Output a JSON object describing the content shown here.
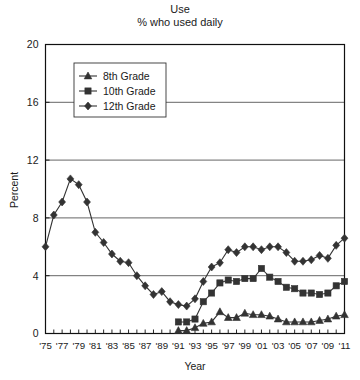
{
  "chart_data": {
    "type": "line",
    "title": "Use",
    "subtitle": "% who used daily",
    "xlabel": "Year",
    "ylabel": "Percent",
    "ylim": [
      0,
      20
    ],
    "yticks": [
      0,
      4,
      8,
      12,
      16,
      20
    ],
    "xlim": [
      1975,
      2011
    ],
    "grid": true,
    "grid_axis": "y",
    "legend_position": "top-left-inside",
    "x": [
      1975,
      1976,
      1977,
      1978,
      1979,
      1980,
      1981,
      1982,
      1983,
      1984,
      1985,
      1986,
      1987,
      1988,
      1989,
      1990,
      1991,
      1992,
      1993,
      1994,
      1995,
      1996,
      1997,
      1998,
      1999,
      2000,
      2001,
      2002,
      2003,
      2004,
      2005,
      2006,
      2007,
      2008,
      2009,
      2010,
      2011
    ],
    "xtick_labels": [
      "'75",
      "'77",
      "'79",
      "'81",
      "'83",
      "'85",
      "'87",
      "'89",
      "'91",
      "'93",
      "'95",
      "'97",
      "'99",
      "'01",
      "'03",
      "'05",
      "'07",
      "'09",
      "'11"
    ],
    "xtick_years": [
      1975,
      1977,
      1979,
      1981,
      1983,
      1985,
      1987,
      1989,
      1991,
      1993,
      1995,
      1997,
      1999,
      2001,
      2003,
      2005,
      2007,
      2009,
      2011
    ],
    "series": [
      {
        "name": "8th Grade",
        "marker": "triangle",
        "color": "#333333",
        "x": [
          1991,
          1992,
          1993,
          1994,
          1995,
          1996,
          1997,
          1998,
          1999,
          2000,
          2001,
          2002,
          2003,
          2004,
          2005,
          2006,
          2007,
          2008,
          2009,
          2010,
          2011
        ],
        "values": [
          0.2,
          0.2,
          0.4,
          0.7,
          0.8,
          1.5,
          1.1,
          1.1,
          1.4,
          1.3,
          1.3,
          1.2,
          1.0,
          0.8,
          0.8,
          0.8,
          0.8,
          0.9,
          1.0,
          1.2,
          1.3
        ]
      },
      {
        "name": "10th Grade",
        "marker": "square",
        "color": "#333333",
        "x": [
          1991,
          1992,
          1993,
          1994,
          1995,
          1996,
          1997,
          1998,
          1999,
          2000,
          2001,
          2002,
          2003,
          2004,
          2005,
          2006,
          2007,
          2008,
          2009,
          2010,
          2011
        ],
        "values": [
          0.8,
          0.8,
          1.0,
          2.2,
          2.8,
          3.5,
          3.7,
          3.6,
          3.8,
          3.8,
          4.5,
          3.9,
          3.6,
          3.2,
          3.1,
          2.8,
          2.8,
          2.7,
          2.8,
          3.3,
          3.6
        ]
      },
      {
        "name": "12th Grade",
        "marker": "diamond",
        "color": "#333333",
        "x": [
          1975,
          1976,
          1977,
          1978,
          1979,
          1980,
          1981,
          1982,
          1983,
          1984,
          1985,
          1986,
          1987,
          1988,
          1989,
          1990,
          1991,
          1992,
          1993,
          1994,
          1995,
          1996,
          1997,
          1998,
          1999,
          2000,
          2001,
          2002,
          2003,
          2004,
          2005,
          2006,
          2007,
          2008,
          2009,
          2010,
          2011
        ],
        "values": [
          6.0,
          8.2,
          9.1,
          10.7,
          10.3,
          9.1,
          7.0,
          6.3,
          5.5,
          5.0,
          4.9,
          4.0,
          3.3,
          2.7,
          2.9,
          2.2,
          2.0,
          1.9,
          2.4,
          3.6,
          4.6,
          4.9,
          5.8,
          5.6,
          6.0,
          6.0,
          5.8,
          6.0,
          6.0,
          5.6,
          5.0,
          5.0,
          5.1,
          5.4,
          5.2,
          6.1,
          6.6
        ]
      }
    ]
  }
}
